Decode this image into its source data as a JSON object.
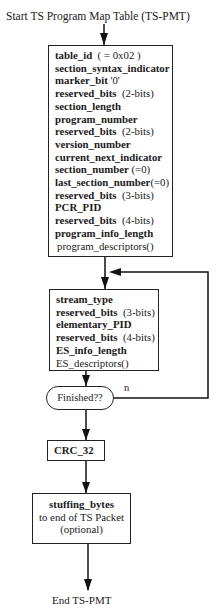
{
  "title": "Start  TS Program Map Table (TS-PMT)",
  "pmt_header_box": {
    "fields": [
      {
        "name": "table_id",
        "note": "( = 0x02 )"
      },
      {
        "name": "section_syntax_indicator",
        "note": ""
      },
      {
        "name": "marker_bit",
        "note": "'0'"
      },
      {
        "name": "reserved_bits",
        "note": "(2-bits)"
      },
      {
        "name": "section_length",
        "note": ""
      },
      {
        "name": "program_number",
        "note": ""
      },
      {
        "name": "reserved_bits",
        "note": "(2-bits)"
      },
      {
        "name": "version_number",
        "note": ""
      },
      {
        "name": "current_next_indicator",
        "note": ""
      },
      {
        "name": "section_number",
        "note": "(=0)"
      },
      {
        "name": "last_section_number",
        "note": "(=0)"
      },
      {
        "name": "reserved_bits",
        "note": "(3-bits)"
      },
      {
        "name": "PCR_PID",
        "note": ""
      },
      {
        "name": "reserved_bits",
        "note": "(4-bits)"
      },
      {
        "name": "program_info_length",
        "note": ""
      }
    ],
    "descriptors": "program_descriptors()"
  },
  "stream_loop_box": {
    "fields": [
      {
        "name": "stream_type",
        "note": ""
      },
      {
        "name": "reserved_bits",
        "note": "(3-bits)"
      },
      {
        "name": "elementary_PID",
        "note": ""
      },
      {
        "name": "reserved_bits",
        "note": "(4-bits)"
      },
      {
        "name": "ES_info_length",
        "note": ""
      }
    ],
    "descriptors": "ES_descriptors()"
  },
  "decision": {
    "label": "Finished??",
    "no_label": "n"
  },
  "crc_box": {
    "label": "CRC_32"
  },
  "stuffing_box": {
    "title": "stuffing_bytes",
    "line2": "to end of TS Packet",
    "line3": "(optional)"
  },
  "end_label": "End TS-PMT"
}
